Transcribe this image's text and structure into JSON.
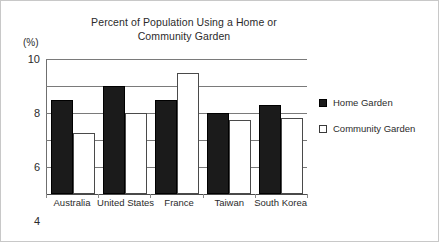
{
  "chart_data": {
    "type": "bar",
    "title": "Percent of Population Using a Home or\nCommunity Garden",
    "xlabel": "",
    "ylabel": "(%)",
    "ylim": [
      0,
      10
    ],
    "yticks": [
      10,
      8,
      6,
      4,
      2,
      0
    ],
    "grid": true,
    "legend_position": "right",
    "categories": [
      "Australia",
      "United States",
      "France",
      "Taiwan",
      "South Korea"
    ],
    "series": [
      {
        "name": "Home Garden",
        "color": "#1b1b1b",
        "values": [
          7,
          8,
          7,
          6,
          6.6
        ]
      },
      {
        "name": "Community Garden",
        "color": "#ffffff",
        "values": [
          4.5,
          6,
          9,
          5.5,
          5.6
        ]
      }
    ]
  }
}
